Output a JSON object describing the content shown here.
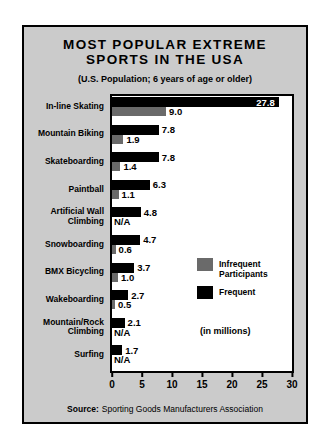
{
  "panel": {
    "background": "#cbcbcb",
    "border_color": "#000000",
    "title_line1": "MOST POPULAR EXTREME",
    "title_line2": "SPORTS IN THE USA",
    "subtitle": "(U.S. Population; 6 years of age or older)",
    "source_label": "Source:",
    "source_text": "Sporting Goods Manufacturers Association"
  },
  "chart_data": {
    "type": "bar",
    "orientation": "horizontal",
    "title": "MOST POPULAR EXTREME SPORTS IN THE USA",
    "subtitle": "(U.S. Population; 6 years of age or older)",
    "units_note": "(in millions)",
    "xlim": [
      0,
      30
    ],
    "x_ticks": [
      "0",
      "5",
      "10",
      "15",
      "20",
      "25",
      "30"
    ],
    "grid": false,
    "legend_position": "inside-right",
    "plot_background": "#ffffff",
    "categories": [
      "In-line Skating",
      "Mountain Biking",
      "Skateboarding",
      "Paintball",
      "Artificial Wall Climbing",
      "Snowboarding",
      "BMX Bicycling",
      "Wakeboarding",
      "Mountain/Rock Climbing",
      "Surfing"
    ],
    "category_lines": [
      [
        "In-line Skating"
      ],
      [
        "Mountain Biking"
      ],
      [
        "Skateboarding"
      ],
      [
        "Paintball"
      ],
      [
        "Artificial Wall",
        "Climbing"
      ],
      [
        "Snowboarding"
      ],
      [
        "BMX Bicycling"
      ],
      [
        "Wakeboarding"
      ],
      [
        "Mountain/Rock",
        "Climbing"
      ],
      [
        "Surfing"
      ]
    ],
    "series": [
      {
        "key": "frequent",
        "name": "Frequent",
        "color": "#000000",
        "values": [
          27.8,
          7.8,
          7.8,
          6.3,
          4.8,
          4.7,
          3.7,
          2.7,
          2.1,
          1.7
        ],
        "labels": [
          "27.8",
          "7.8",
          "7.8",
          "6.3",
          "4.8",
          "4.7",
          "3.7",
          "2.7",
          "2.1",
          "1.7"
        ]
      },
      {
        "key": "infrequent",
        "name": "Infrequent Participants",
        "color": "#6a6a6a",
        "values": [
          9.0,
          1.9,
          1.4,
          1.1,
          null,
          0.6,
          1.0,
          0.5,
          null,
          null
        ],
        "labels": [
          "9.0",
          "1.9",
          "1.4",
          "1.1",
          "N/A",
          "0.6",
          "1.0",
          "0.5",
          "N/A",
          "N/A"
        ]
      }
    ],
    "legend": [
      {
        "key": "infrequent",
        "color": "#6a6a6a",
        "label_lines": [
          "Infrequent",
          "Participants"
        ]
      },
      {
        "key": "frequent",
        "color": "#000000",
        "label_lines": [
          "Frequent"
        ]
      }
    ]
  }
}
